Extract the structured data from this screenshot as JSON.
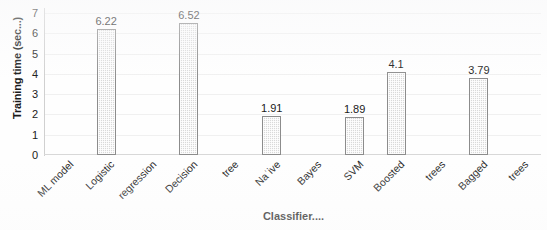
{
  "chart_data": {
    "type": "bar",
    "title": "",
    "xlabel": "Classifier....",
    "ylabel": "Training time (sec...)",
    "categories": [
      "Logistic regression",
      "Decision tree",
      "Naïve Bayes",
      "SVM",
      "Boosted trees",
      "Bagged trees"
    ],
    "values": [
      6.22,
      6.52,
      1.91,
      1.89,
      4.1,
      3.79
    ],
    "value_labels": [
      "6.22",
      "6.52",
      "1.91",
      "1.89",
      "4.1",
      "3.79"
    ],
    "ylim": [
      0,
      7
    ],
    "y_ticks": [
      0,
      1,
      2,
      3,
      4,
      5,
      6,
      7
    ],
    "y_tick_labels": [
      "0",
      "1",
      "2",
      "3",
      "4",
      "5",
      "6",
      "7"
    ],
    "grid": true,
    "legend": false,
    "x_tick_slots": [
      "ML model",
      "Logistic",
      "regression",
      "Decision",
      "tree",
      "Naˈive",
      "Bayes",
      "SVM",
      "Boosted",
      "trees",
      "Bagged",
      "trees"
    ],
    "bar_slot_index": [
      1,
      3,
      5,
      7,
      8,
      10
    ],
    "colors": {
      "bar_fill": "#d9d9d9",
      "bar_border": "#8c8c8c",
      "grid": "#f0f0f0",
      "axis": "#d0d0d0",
      "text": "#1a1a1a",
      "background": "#fefefe"
    }
  }
}
